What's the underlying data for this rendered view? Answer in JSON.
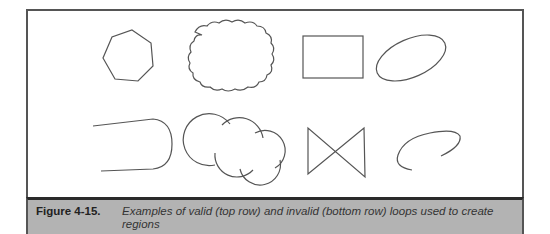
{
  "figure": {
    "label": "Figure 4-15.",
    "caption": "Examples of valid (top row) and invalid (bottom row) loops used to create regions"
  },
  "rows": {
    "top": {
      "description": "valid loops",
      "shapes": [
        "heptagon",
        "cloud",
        "rectangle",
        "ellipse"
      ]
    },
    "bottom": {
      "description": "invalid loops",
      "shapes": [
        "open-u-shape",
        "overlapping-circles",
        "bowtie",
        "open-ellipse"
      ]
    }
  },
  "colors": {
    "stroke": "#555555",
    "caption_background": "#b3b3b3",
    "caption_divider": "#2a2a2a"
  }
}
